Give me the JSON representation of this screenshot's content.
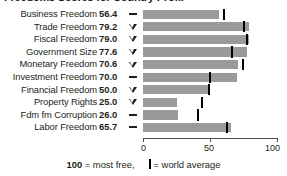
{
  "title": "Freedoms Scores for Country Profile",
  "chart_data": {
    "type": "bar",
    "title": "Freedoms Scores for Country Profile",
    "xlabel": "",
    "ylabel": "",
    "xlim": [
      0,
      100
    ],
    "xticks": [
      0,
      50,
      100
    ],
    "xtick_labels": [
      "0",
      "50",
      "100"
    ],
    "grid": false,
    "legend_position": "bottom",
    "orientation": "horizontal",
    "bar_color": "#9a9a9a",
    "marker_color": "#000000",
    "categories": [
      "Business Freedom",
      "Trade Freedom",
      "Fiscal Freedom",
      "Government Size",
      "Monetary Freedom",
      "Investment Freedom",
      "Financial Freedom",
      "Property Rights",
      "Fdm fm Corruption",
      "Labor Freedom"
    ],
    "values": [
      56.4,
      79.2,
      79.0,
      77.6,
      70.6,
      70.0,
      50.0,
      25.0,
      26.0,
      65.7
    ],
    "world_average": [
      60.0,
      74.5,
      76.5,
      66.0,
      74.0,
      49.5,
      48.5,
      43.0,
      40.0,
      62.0
    ],
    "trend": [
      "flat",
      "down",
      "down",
      "down",
      "down",
      "flat",
      "down",
      "down",
      "flat",
      "flat"
    ],
    "series": [
      {
        "name": "Country score",
        "values": [
          56.4,
          79.2,
          79.0,
          77.6,
          70.6,
          70.0,
          50.0,
          25.0,
          26.0,
          65.7
        ]
      },
      {
        "name": "World average",
        "values": [
          60.0,
          74.5,
          76.5,
          66.0,
          74.0,
          49.5,
          48.5,
          43.0,
          40.0,
          62.0
        ]
      }
    ]
  },
  "rows": [
    {
      "label": "Business Freedom",
      "value": "56.4",
      "trend": "flat",
      "bar": 56.4,
      "avg": 60.0
    },
    {
      "label": "Trade Freedom",
      "value": "79.2",
      "trend": "down",
      "bar": 79.2,
      "avg": 74.5
    },
    {
      "label": "Fiscal Freedom",
      "value": "79.0",
      "trend": "down",
      "bar": 79.0,
      "avg": 76.5
    },
    {
      "label": "Government Size",
      "value": "77.6",
      "trend": "down",
      "bar": 77.6,
      "avg": 66.0
    },
    {
      "label": "Monetary Freedom",
      "value": "70.6",
      "trend": "down",
      "bar": 70.6,
      "avg": 74.0
    },
    {
      "label": "Investment Freedom",
      "value": "70.0",
      "trend": "flat",
      "bar": 70.0,
      "avg": 49.5
    },
    {
      "label": "Financial Freedom",
      "value": "50.0",
      "trend": "down",
      "bar": 50.0,
      "avg": 48.5
    },
    {
      "label": "Property Rights",
      "value": "25.0",
      "trend": "down",
      "bar": 25.0,
      "avg": 43.0
    },
    {
      "label": "Fdm fm Corruption",
      "value": "26.0",
      "trend": "flat",
      "bar": 26.0,
      "avg": 40.0
    },
    {
      "label": "Labor Freedom",
      "value": "65.7",
      "trend": "flat",
      "bar": 65.7,
      "avg": 62.0
    }
  ],
  "axis": {
    "ticks": [
      {
        "value": 0,
        "label": "0"
      },
      {
        "value": 50,
        "label": "50"
      },
      {
        "value": 100,
        "label": "100"
      }
    ]
  },
  "legend": {
    "most_free_value": "100",
    "most_free_text": "= most free,",
    "world_average_text": "= world average"
  }
}
